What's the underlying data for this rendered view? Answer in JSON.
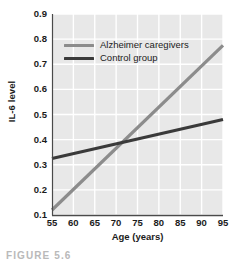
{
  "chart_data": {
    "type": "line",
    "title": "",
    "xlabel": "Age (years)",
    "ylabel": "IL-6 level",
    "xlim": [
      55,
      95
    ],
    "ylim": [
      0.1,
      0.9
    ],
    "grid": true,
    "legend_position": "top-left-inside",
    "x_ticks": [
      "55",
      "60",
      "65",
      "70",
      "75",
      "80",
      "85",
      "90",
      "95"
    ],
    "y_ticks": [
      "0.1",
      "0.2",
      "0.3",
      "0.4",
      "0.5",
      "0.6",
      "0.7",
      "0.8",
      "0.9"
    ],
    "x": [
      55,
      95
    ],
    "series": [
      {
        "name": "Alzheimer caregivers",
        "color": "#8c8c8c",
        "values": [
          0.12,
          0.775
        ]
      },
      {
        "name": "Control group",
        "color": "#3a3a3a",
        "values": [
          0.325,
          0.48
        ]
      }
    ],
    "intersection": {
      "x": 71,
      "y": 0.385
    }
  },
  "figure": {
    "caption": "FIGURE 5.6",
    "plot_bg": "#e8e8e8",
    "gridline_color": "#ffffff",
    "axis_color": "#4a4a4a"
  }
}
